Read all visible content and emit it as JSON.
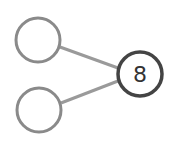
{
  "diagram": {
    "type": "number-bond",
    "whole": {
      "value": "8",
      "cx": 140,
      "cy": 74,
      "r": 22,
      "stroke": "#444444"
    },
    "parts": [
      {
        "value": "",
        "cx": 38,
        "cy": 40,
        "r": 22,
        "stroke": "#8a8a8a"
      },
      {
        "value": "",
        "cx": 39,
        "cy": 110,
        "r": 22,
        "stroke": "#8a8a8a"
      }
    ],
    "connector_color": "#9a9a9a",
    "background": "#ffffff"
  }
}
